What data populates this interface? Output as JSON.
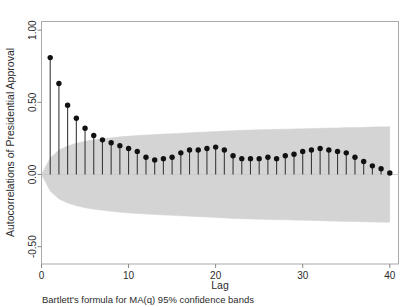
{
  "chart_data": {
    "type": "scatter",
    "subtype": "autocorrelation-stem-plot",
    "title": "",
    "xlabel": "Lag",
    "ylabel": "Autocorrelations of Presidential Approval",
    "caption": "Bartlett's formula for MA(q) 95% confidence bands",
    "xlim": [
      0,
      41
    ],
    "ylim": [
      -0.62,
      1.06
    ],
    "xticks": [
      0,
      10,
      20,
      30,
      40
    ],
    "xtick_labels": [
      "0",
      "10",
      "20",
      "30",
      "40"
    ],
    "yticks": [
      1.0,
      0.5,
      0.0,
      -0.5
    ],
    "ytick_labels": [
      "1.00",
      "0.50",
      "0.00",
      "-0.50"
    ],
    "grid": false,
    "legend": "none",
    "zero_line": 0.0,
    "x": [
      1,
      2,
      3,
      4,
      5,
      6,
      7,
      8,
      9,
      10,
      11,
      12,
      13,
      14,
      15,
      16,
      17,
      18,
      19,
      20,
      21,
      22,
      23,
      24,
      25,
      26,
      27,
      28,
      29,
      30,
      31,
      32,
      33,
      34,
      35,
      36,
      37,
      38,
      39,
      40
    ],
    "values": [
      0.81,
      0.63,
      0.48,
      0.39,
      0.32,
      0.27,
      0.24,
      0.22,
      0.2,
      0.18,
      0.16,
      0.12,
      0.1,
      0.11,
      0.12,
      0.15,
      0.17,
      0.17,
      0.18,
      0.19,
      0.17,
      0.13,
      0.11,
      0.11,
      0.11,
      0.12,
      0.11,
      0.13,
      0.14,
      0.16,
      0.17,
      0.18,
      0.17,
      0.16,
      0.15,
      0.12,
      0.09,
      0.06,
      0.04,
      0.01
    ],
    "confidence_band": {
      "label": "Bartlett 95% confidence band",
      "color": "#d4d4d4",
      "upper": [
        0.115,
        0.169,
        0.198,
        0.217,
        0.23,
        0.24,
        0.248,
        0.255,
        0.261,
        0.266,
        0.27,
        0.274,
        0.277,
        0.28,
        0.283,
        0.286,
        0.289,
        0.292,
        0.295,
        0.298,
        0.301,
        0.304,
        0.306,
        0.308,
        0.31,
        0.311,
        0.313,
        0.314,
        0.316,
        0.317,
        0.319,
        0.32,
        0.322,
        0.323,
        0.325,
        0.326,
        0.327,
        0.329,
        0.33,
        0.331
      ],
      "lower": [
        -0.115,
        -0.169,
        -0.198,
        -0.217,
        -0.23,
        -0.24,
        -0.248,
        -0.255,
        -0.261,
        -0.266,
        -0.27,
        -0.274,
        -0.277,
        -0.28,
        -0.283,
        -0.286,
        -0.289,
        -0.292,
        -0.295,
        -0.298,
        -0.301,
        -0.304,
        -0.306,
        -0.308,
        -0.31,
        -0.311,
        -0.313,
        -0.314,
        -0.316,
        -0.317,
        -0.319,
        -0.32,
        -0.322,
        -0.323,
        -0.325,
        -0.326,
        -0.327,
        -0.329,
        -0.33,
        -0.331
      ]
    },
    "colors": {
      "marker": "#111111",
      "stem": "#3a3a3a",
      "band": "#d4d4d4",
      "frame": "#aaaaaa",
      "text": "#2b2b2b"
    }
  }
}
